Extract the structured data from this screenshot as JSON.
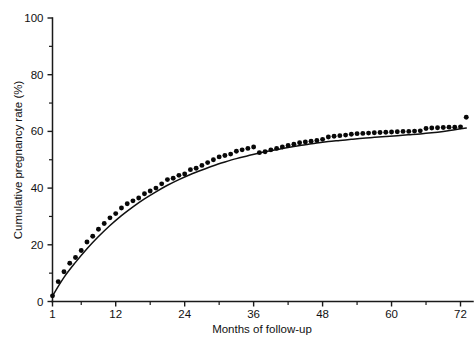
{
  "chart_data": {
    "type": "scatter",
    "title": "",
    "xlabel": "Months of follow-up",
    "ylabel": "Cumulative pregnancy rate (%)",
    "xlim": [
      1,
      74
    ],
    "ylim": [
      0,
      100
    ],
    "grid": false,
    "legend": null,
    "xticks": [
      1,
      12,
      24,
      36,
      48,
      60,
      72
    ],
    "xtick_labels": [
      "1",
      "12",
      "24",
      "36",
      "48",
      "60",
      "72"
    ],
    "xminor_ticks": [
      6,
      18,
      30,
      42,
      54,
      66
    ],
    "yticks": [
      0,
      20,
      40,
      60,
      80,
      100
    ],
    "ytick_labels": [
      "0",
      "20",
      "40",
      "60",
      "80",
      "100"
    ],
    "yminor_ticks": [
      10,
      30,
      50,
      70,
      90
    ],
    "marker": "filled-circle",
    "marker_color": "#080808",
    "series": [
      {
        "name": "Observed cumulative pregnancy rate",
        "x": [
          1,
          2,
          3,
          4,
          5,
          6,
          7,
          8,
          9,
          10,
          11,
          12,
          13,
          14,
          15,
          16,
          17,
          18,
          19,
          20,
          21,
          22,
          23,
          24,
          25,
          26,
          27,
          28,
          29,
          30,
          31,
          32,
          33,
          34,
          35,
          36,
          37,
          38,
          39,
          40,
          41,
          42,
          43,
          44,
          45,
          46,
          47,
          48,
          49,
          50,
          51,
          52,
          53,
          54,
          55,
          56,
          57,
          58,
          59,
          60,
          61,
          62,
          63,
          64,
          65,
          66,
          67,
          68,
          69,
          70,
          71,
          72,
          73
        ],
        "y": [
          2.0,
          7.0,
          10.5,
          13.5,
          15.5,
          18.0,
          21.0,
          23.0,
          25.5,
          27.5,
          29.5,
          31.0,
          33.0,
          34.5,
          35.5,
          36.5,
          38.0,
          39.0,
          40.0,
          41.5,
          43.0,
          43.5,
          44.5,
          45.0,
          46.5,
          47.0,
          48.0,
          49.0,
          50.0,
          51.0,
          51.5,
          52.0,
          53.0,
          53.5,
          54.0,
          54.5,
          52.5,
          52.8,
          53.5,
          54.0,
          54.5,
          55.0,
          55.5,
          56.0,
          56.3,
          56.5,
          56.8,
          57.2,
          58.0,
          58.3,
          58.5,
          58.7,
          59.0,
          59.2,
          59.3,
          59.4,
          59.5,
          59.6,
          59.7,
          59.8,
          59.9,
          60.0,
          60.0,
          60.1,
          60.2,
          61.0,
          61.2,
          61.3,
          61.4,
          61.5,
          61.5,
          61.6,
          65.0
        ]
      }
    ],
    "fitted_curve": {
      "name": "Fitted cumulative rate curve",
      "style": "solid",
      "color": "#111111",
      "x": [
        1,
        3,
        5,
        7,
        9,
        11,
        13,
        15,
        17,
        19,
        21,
        23,
        25,
        27,
        29,
        31,
        33,
        35,
        37,
        39,
        41,
        43,
        45,
        47,
        49,
        51,
        53,
        55,
        57,
        59,
        61,
        63,
        65,
        67,
        69,
        71,
        73
      ],
      "y": [
        2.0,
        8.5,
        13.8,
        18.6,
        22.9,
        26.8,
        30.3,
        33.4,
        36.2,
        38.7,
        41.0,
        43.0,
        44.8,
        46.4,
        47.9,
        49.2,
        50.4,
        51.4,
        52.4,
        53.2,
        54.0,
        54.7,
        55.3,
        55.9,
        56.4,
        56.8,
        57.2,
        57.6,
        57.9,
        58.2,
        58.5,
        58.8,
        59.1,
        59.5,
        60.0,
        60.6,
        61.2
      ]
    }
  },
  "axes": {
    "y_axis_label": "Cumulative pregnancy rate (%)",
    "x_axis_label": "Months of follow-up"
  }
}
